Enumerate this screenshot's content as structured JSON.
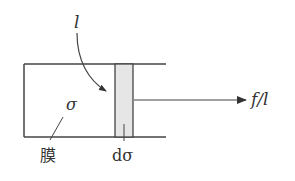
{
  "diagram": {
    "labels": {
      "length": "l",
      "surface_tension": "σ",
      "film": "膜",
      "increment": "dσ",
      "force": "f/l"
    },
    "colors": {
      "stroke": "#444444",
      "strip_fill": "#e6e6e6",
      "text": "#333333"
    }
  }
}
